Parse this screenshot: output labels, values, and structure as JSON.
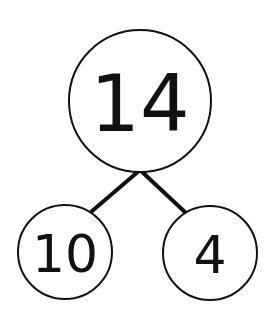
{
  "diagram": {
    "type": "number-bond",
    "whole": {
      "value": "14"
    },
    "parts": [
      {
        "value": "10"
      },
      {
        "value": "4"
      }
    ],
    "colors": {
      "stroke": "#111111",
      "background": "#ffffff"
    }
  }
}
